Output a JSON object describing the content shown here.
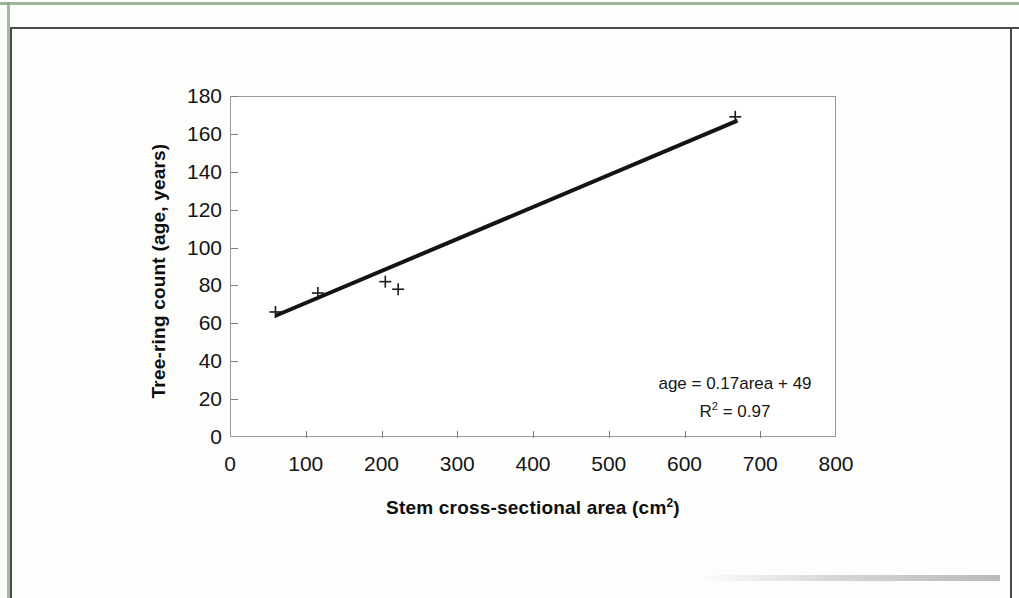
{
  "figure": {
    "y_axis_title": "Tree-ring count (age, years)",
    "x_axis_title_main": "Stem cross-sectional area (cm",
    "x_axis_title_sup": "2",
    "x_axis_title_close": ")",
    "equation_line": "age = 0.17area + 49",
    "r2_prefix": "R",
    "r2_sup": "2",
    "r2_value": " = 0.97"
  },
  "chart_data": {
    "type": "scatter",
    "title": "",
    "xlabel": "Stem cross-sectional area (cm2)",
    "ylabel": "Tree-ring count (age, years)",
    "xlim": [
      0,
      800
    ],
    "ylim": [
      0,
      180
    ],
    "xticks": [
      0,
      100,
      200,
      300,
      400,
      500,
      600,
      700,
      800
    ],
    "yticks": [
      0,
      20,
      40,
      60,
      80,
      100,
      120,
      140,
      160,
      180
    ],
    "grid": false,
    "legend": "none",
    "marker": "plus",
    "marker_color": "#1a1a1a",
    "points": [
      {
        "x": 60,
        "y": 66
      },
      {
        "x": 116,
        "y": 76
      },
      {
        "x": 205,
        "y": 82
      },
      {
        "x": 222,
        "y": 78
      },
      {
        "x": 667,
        "y": 169
      }
    ],
    "trendline": {
      "slope": 0.17,
      "intercept": 49,
      "r_squared": 0.97,
      "color": "#141414",
      "width": 4,
      "x_start": 60,
      "x_end": 670,
      "y_start": 64,
      "y_end": 167,
      "equation_text": "age = 0.17area + 49",
      "r2_text": "R2 = 0.97"
    }
  }
}
